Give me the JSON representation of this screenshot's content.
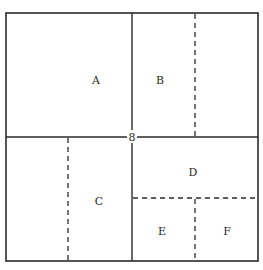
{
  "diagram": {
    "type": "square-partition",
    "outer": {
      "x1": 6,
      "y1": 13,
      "x2": 258,
      "y2": 261
    },
    "center_label": "8",
    "regions": [
      {
        "id": "A",
        "label": "A",
        "x": 96,
        "y": 80
      },
      {
        "id": "B",
        "label": "B",
        "x": 160,
        "y": 80
      },
      {
        "id": "C",
        "label": "C",
        "x": 99,
        "y": 201
      },
      {
        "id": "D",
        "label": "D",
        "x": 193,
        "y": 172
      },
      {
        "id": "E",
        "label": "E",
        "x": 162,
        "y": 231
      },
      {
        "id": "F",
        "label": "F",
        "x": 227,
        "y": 231
      }
    ],
    "solid_lines": [
      {
        "name": "vertical-divider",
        "x1": 132,
        "y1": 13,
        "x2": 132,
        "y2": 261
      },
      {
        "name": "horizontal-divider",
        "x1": 6,
        "y1": 137,
        "x2": 258,
        "y2": 137
      }
    ],
    "dashed_lines": [
      {
        "name": "b-split",
        "x1": 195,
        "y1": 13,
        "x2": 195,
        "y2": 137
      },
      {
        "name": "c-split",
        "x1": 68,
        "y1": 137,
        "x2": 68,
        "y2": 261
      },
      {
        "name": "d-split",
        "x1": 132,
        "y1": 198,
        "x2": 258,
        "y2": 198
      },
      {
        "name": "ef-split",
        "x1": 195,
        "y1": 198,
        "x2": 195,
        "y2": 261
      }
    ]
  },
  "colors": {
    "line": "#2a2a2a",
    "background": "#ffffff"
  }
}
